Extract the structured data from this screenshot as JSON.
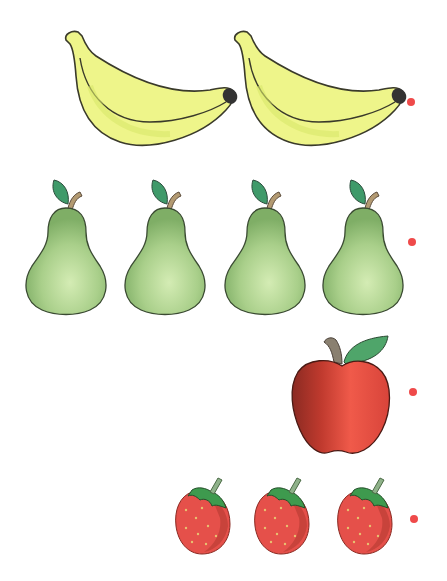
{
  "worksheet": {
    "background": "#ffffff",
    "dot_color": "#ef4a4a",
    "rows": [
      {
        "fruit": "banana",
        "count": 2,
        "label": "bananas",
        "colors": {
          "body": "#eef58a",
          "shade": "#d9e86a",
          "outline": "#3a3a2a",
          "tip": "#333333"
        }
      },
      {
        "fruit": "pear",
        "count": 4,
        "label": "pears",
        "colors": {
          "body": "#a9cf8a",
          "light": "#d4ecb4",
          "dark": "#7fae66",
          "leaf": "#3f9a6a",
          "stem": "#b39a72"
        }
      },
      {
        "fruit": "apple",
        "count": 1,
        "label": "apple",
        "colors": {
          "body": "#e8453a",
          "dark": "#9a2a22",
          "light": "#f36a55",
          "leaf": "#4fa56a",
          "stem": "#8a8070"
        }
      },
      {
        "fruit": "strawberry",
        "count": 3,
        "label": "strawberries",
        "colors": {
          "body": "#e5504a",
          "dark": "#b43a32",
          "seed": "#e8c070",
          "leaf": "#3e9a4e",
          "stem": "#8fb28a"
        }
      }
    ]
  }
}
